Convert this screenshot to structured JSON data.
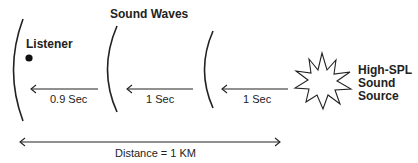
{
  "title": "Sound Waves",
  "listener": {
    "label": "Listener"
  },
  "source": {
    "label_lines": [
      "High-SPL",
      "Sound",
      "Source"
    ]
  },
  "segments": [
    {
      "label": "0.9 Sec"
    },
    {
      "label": "1 Sec"
    },
    {
      "label": "1 Sec"
    }
  ],
  "distance": {
    "label": "Distance = 1 KM"
  },
  "colors": {
    "stroke": "#222222",
    "background": "#ffffff"
  }
}
